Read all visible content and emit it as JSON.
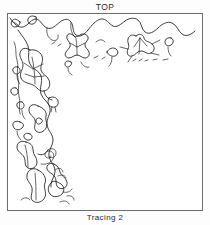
{
  "figure": {
    "top_label": "TOP",
    "bottom_label": "Tracing 2",
    "orientation_marker": "TOP",
    "plate": {
      "border_color": "#6d6d6d",
      "background_color": "#ffffff",
      "ink_color": "#1b1b1b"
    },
    "content_description": "Hand-drawn tracing of a floral and vine border motif occupying the top edge and left edge of the rectangular plate, leaving the interior blank"
  }
}
